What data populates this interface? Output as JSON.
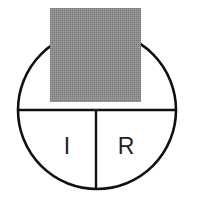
{
  "figure": {
    "background_color": "#ffffff",
    "canvas": {
      "width": 198,
      "height": 208
    }
  },
  "circle": {
    "name": "outline-circle",
    "center_x": 97,
    "center_y": 110,
    "radius": 79,
    "stroke_color": "#111111",
    "stroke_width": 2.6,
    "fill": "none"
  },
  "lines": {
    "horizontal_diameter": {
      "name": "horizontal-diameter-line",
      "x1": 18,
      "y1": 110,
      "x2": 176,
      "y2": 110,
      "stroke_color": "#111111",
      "stroke_width": 2.4
    },
    "vertical_radius": {
      "name": "vertical-divider-line",
      "x1": 96,
      "y1": 110,
      "x2": 96,
      "y2": 189,
      "stroke_color": "#111111",
      "stroke_width": 2.4
    }
  },
  "occluding_square": {
    "name": "gray-square-overlay",
    "x": 50,
    "y": 8,
    "width": 91,
    "height": 94,
    "fill_color": "#8a8a8a",
    "pattern": "dither-halftone"
  },
  "labels": {
    "left_quadrant": {
      "name": "label-I",
      "text": "I",
      "x": 67,
      "y": 148,
      "color": "#222222"
    },
    "right_quadrant": {
      "name": "label-R",
      "text": "R",
      "x": 126,
      "y": 148,
      "color": "#222222"
    }
  }
}
